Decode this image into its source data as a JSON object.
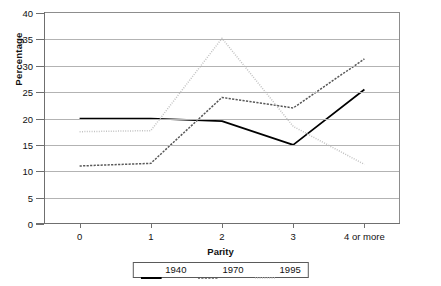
{
  "chart_data": {
    "type": "line",
    "title": "",
    "xlabel": "Parity",
    "ylabel": "Percentage",
    "categories": [
      "0",
      "1",
      "2",
      "3",
      "4 or more"
    ],
    "ylim": [
      0,
      40
    ],
    "ytick_step": 5,
    "yticks": [
      "0",
      "5",
      "10",
      "15",
      "20",
      "25",
      "30",
      "35",
      "40"
    ],
    "grid": true,
    "grid_axis": "y",
    "legend_position": "bottom-center",
    "series": [
      {
        "name": "1940",
        "color": "#000000",
        "style": "solid",
        "values": [
          20.0,
          20.0,
          19.5,
          15.0,
          25.5
        ]
      },
      {
        "name": "1970",
        "color": "#585858",
        "style": "dashed",
        "values": [
          11.0,
          11.5,
          24.0,
          22.0,
          31.3
        ]
      },
      {
        "name": "1995",
        "color": "#c2c2c2",
        "style": "dotted",
        "values": [
          17.5,
          17.7,
          35.2,
          18.5,
          11.3
        ]
      }
    ]
  },
  "colors": {
    "axis": "#6f6f6f",
    "grid": "#b3b3b3",
    "background": "#ffffff",
    "series_1940": "#000000",
    "series_1970": "#585858",
    "series_1995": "#c2c2c2"
  }
}
